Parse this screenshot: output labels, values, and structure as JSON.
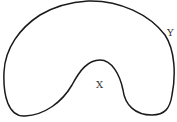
{
  "diagram": {
    "type": "closed-curve-region",
    "labels": {
      "y": "Y",
      "x": "X"
    },
    "stroke_color": "#1a1a1a",
    "background": "#ffffff",
    "top_text_fragment": ""
  }
}
